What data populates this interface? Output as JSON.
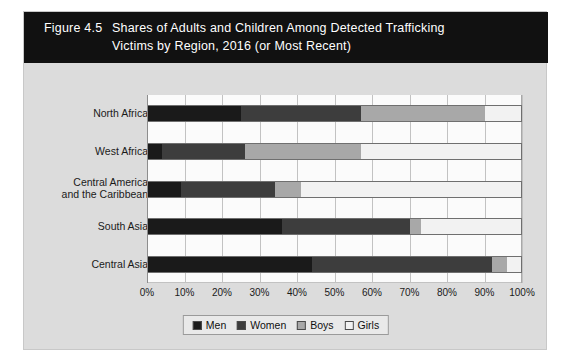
{
  "figure": {
    "number": "Figure 4.5",
    "title_line1": "Shares of Adults and Children Among Detected Trafficking",
    "title_line2": "Victims by Region, 2016 (or Most Recent)"
  },
  "chart_data": {
    "type": "bar",
    "orientation": "horizontal",
    "stacked": true,
    "normalized_percent": true,
    "title": "Figure 4.5  Shares of Adults and Children Among Detected Trafficking Victims by Region, 2016 (or Most Recent)",
    "xlabel": "",
    "ylabel": "",
    "xlim": [
      0,
      100
    ],
    "grid": true,
    "legend_position": "bottom",
    "categories": [
      "North Africa",
      "West Africa",
      "Central America and the Caribbean",
      "South Asia",
      "Central Asia"
    ],
    "tick_labels": [
      "0%",
      "10%",
      "20%",
      "30%",
      "40%",
      "50%",
      "60%",
      "70%",
      "80%",
      "90%",
      "100%"
    ],
    "tick_values": [
      0,
      10,
      20,
      30,
      40,
      50,
      60,
      70,
      80,
      90,
      100
    ],
    "series": [
      {
        "name": "Men",
        "color": "#1a1a1a",
        "values": [
          25,
          4,
          9,
          36,
          44
        ]
      },
      {
        "name": "Women",
        "color": "#3d3d3d",
        "values": [
          32,
          22,
          25,
          34,
          48
        ]
      },
      {
        "name": "Boys",
        "color": "#a8a8a8",
        "values": [
          33,
          31,
          7,
          3,
          4
        ]
      },
      {
        "name": "Girls",
        "color": "#f2f2f2",
        "values": [
          10,
          43,
          59,
          27,
          4
        ]
      }
    ]
  },
  "legend": {
    "items": [
      {
        "label": "Men"
      },
      {
        "label": "Women"
      },
      {
        "label": "Boys"
      },
      {
        "label": "Girls"
      }
    ]
  }
}
